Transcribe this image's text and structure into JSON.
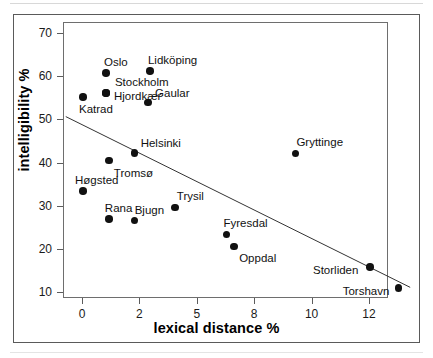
{
  "chart_data": {
    "type": "scatter",
    "title": "",
    "subtitle": "",
    "xlabel": "lexical distance %",
    "ylabel": "intelligibility %",
    "xtick_labels": [
      "0",
      "2",
      "5",
      "8",
      "10",
      "12"
    ],
    "ytick_labels": [
      "10",
      "20",
      "30",
      "40",
      "50",
      "60",
      "70"
    ],
    "xlim": [
      -0.6,
      13.4
    ],
    "ylim": [
      8.6,
      72.6
    ],
    "grid": false,
    "legend": null,
    "legend_position": "none",
    "note": "x-axis tick labels 0,2,5,8,10,12 are drawn at equal pixel spacing (non-linear axis)",
    "points": [
      {
        "label": "Katrad",
        "x": 0.0,
        "y": 55.4,
        "label_dx": -4,
        "label_dy": 13
      },
      {
        "label": "Oslo",
        "x": 0.8,
        "y": 61.0,
        "label_dx": -2,
        "label_dy": -10
      },
      {
        "label": "Stockholm",
        "x": 0.8,
        "y": 56.4,
        "label_dx": 9,
        "label_dy": -10
      },
      {
        "label": "Hjordkær",
        "x": 0.8,
        "y": 56.4,
        "label_dx": 8,
        "label_dy": 4
      },
      {
        "label": "Lidköping",
        "x": 2.5,
        "y": 61.5,
        "label_dx": -2,
        "label_dy": -10
      },
      {
        "label": "Gaular",
        "x": 2.4,
        "y": 54.2,
        "label_dx": 7,
        "label_dy": -8
      },
      {
        "label": "Helsinki",
        "x": 1.8,
        "y": 42.5,
        "label_dx": 6,
        "label_dy": -9
      },
      {
        "label": "Tromsø",
        "x": 0.9,
        "y": 40.7,
        "label_dx": 5,
        "label_dy": 13
      },
      {
        "label": "Høgsted",
        "x": 0.0,
        "y": 33.7,
        "label_dx": -8,
        "label_dy": -10
      },
      {
        "label": "Rana",
        "x": 0.9,
        "y": 27.2,
        "label_dx": -4,
        "label_dy": -10
      },
      {
        "label": "Bjugn",
        "x": 1.8,
        "y": 26.8,
        "label_dx": 0,
        "label_dy": -10
      },
      {
        "label": "Trysil",
        "x": 3.8,
        "y": 29.8,
        "label_dx": 2,
        "label_dy": -11
      },
      {
        "label": "Fyresdal",
        "x": 6.5,
        "y": 23.6,
        "label_dx": -3,
        "label_dy": -10
      },
      {
        "label": "Oppdal",
        "x": 6.9,
        "y": 20.8,
        "label_dx": 5,
        "label_dy": 13
      },
      {
        "label": "Gryttinge",
        "x": 9.4,
        "y": 42.3,
        "label_dx": 1,
        "label_dy": -11
      },
      {
        "label": "Storliden",
        "x": 12.0,
        "y": 16.0,
        "label_dx": -57,
        "label_dy": 4
      },
      {
        "label": "Torshavn",
        "x": 13.0,
        "y": 11.2,
        "label_dx": -56,
        "label_dy": 4
      }
    ],
    "trendline": {
      "type": "linear-fit",
      "x_start": -0.6,
      "y_start": 50.9,
      "x_end": 13.4,
      "y_end": 11.3
    }
  }
}
